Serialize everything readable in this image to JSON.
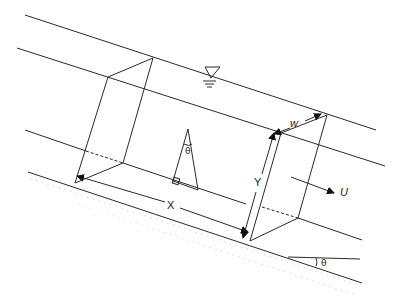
{
  "diagram": {
    "labels": {
      "x_length": "X",
      "y_depth": "Y",
      "w_width": "w",
      "velocity": "U",
      "angle_inner": "θ",
      "angle_slope": "θ"
    },
    "colors": {
      "stroke": "#2a2a2a",
      "background": "#ffffff"
    }
  }
}
